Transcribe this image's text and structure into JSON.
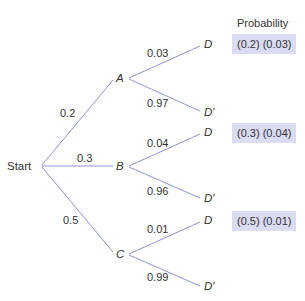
{
  "diagram": {
    "type": "probability-tree",
    "line_color": "#8e93d6",
    "box_color": "#d9dcf3",
    "root": "Start",
    "header": "Probability",
    "level1": [
      {
        "node": "A",
        "prob": "0.2",
        "children": [
          {
            "node": "D",
            "prob": "0.03"
          },
          {
            "node": "D′",
            "prob": "0.97"
          }
        ],
        "joint": "(0.2) (0.03)"
      },
      {
        "node": "B",
        "prob": "0.3",
        "children": [
          {
            "node": "D",
            "prob": "0.04"
          },
          {
            "node": "D′",
            "prob": "0.96"
          }
        ],
        "joint": "(0.3) (0.04)"
      },
      {
        "node": "C",
        "prob": "0.5",
        "children": [
          {
            "node": "D",
            "prob": "0.01"
          },
          {
            "node": "D′",
            "prob": "0.99"
          }
        ],
        "joint": "(0.5) (0.01)"
      }
    ]
  }
}
